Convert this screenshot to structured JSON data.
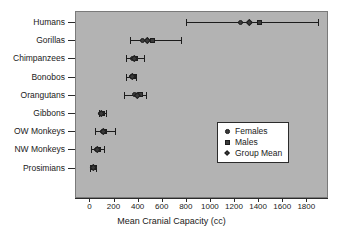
{
  "chart_data": {
    "type": "scatter",
    "title": "",
    "xlabel": "Mean Cranial Capacity (cc)",
    "ylabel": "",
    "xlim": [
      -120,
      1980
    ],
    "xticks": [
      0,
      200,
      400,
      600,
      800,
      1000,
      1200,
      1400,
      1600,
      1800
    ],
    "xticklabels": [
      "0",
      "200",
      "400",
      "600",
      "800",
      "1000",
      "1200",
      "1400",
      "1600",
      "1800"
    ],
    "grid": false,
    "legend_position": "center-right",
    "legend": [
      {
        "label": "Females",
        "marker": "circle"
      },
      {
        "label": "Males",
        "marker": "square"
      },
      {
        "label": "Group Mean",
        "marker": "diamond"
      }
    ],
    "categories": [
      "Humans",
      "Gorillas",
      "Chimpanzees",
      "Bonobos",
      "Orangutans",
      "Gibbons",
      "OW Monkeys",
      "NW Monkeys",
      "Prosimians"
    ],
    "series": [
      {
        "name": "Females",
        "marker": "circle",
        "values": [
          1250,
          440,
          355,
          345,
          370,
          95,
          105,
          60,
          25
        ]
      },
      {
        "name": "Males",
        "marker": "square",
        "values": [
          1410,
          520,
          385,
          365,
          420,
          108,
          125,
          78,
          32
        ]
      },
      {
        "name": "Group Mean",
        "marker": "diamond",
        "values": [
          1330,
          480,
          370,
          355,
          395,
          101,
          115,
          68,
          28
        ]
      }
    ],
    "ranges": [
      {
        "category": "Humans",
        "low": 800,
        "high": 1900
      },
      {
        "category": "Gorillas",
        "low": 340,
        "high": 760
      },
      {
        "category": "Chimpanzees",
        "low": 300,
        "high": 450
      },
      {
        "category": "Bonobos",
        "low": 300,
        "high": 390
      },
      {
        "category": "Orangutans",
        "low": 290,
        "high": 470
      },
      {
        "category": "Gibbons",
        "low": 80,
        "high": 140
      },
      {
        "category": "OW Monkeys",
        "low": 45,
        "high": 215
      },
      {
        "category": "NW Monkeys",
        "low": 15,
        "high": 120
      },
      {
        "category": "Prosimians",
        "low": 5,
        "high": 55
      }
    ]
  },
  "colors": {
    "panel_background": "#b3b3b3",
    "marker": "#3a3a3a",
    "line": "#1c1c1c",
    "text": "#1a1a1a",
    "legend_background": "#ffffff"
  }
}
